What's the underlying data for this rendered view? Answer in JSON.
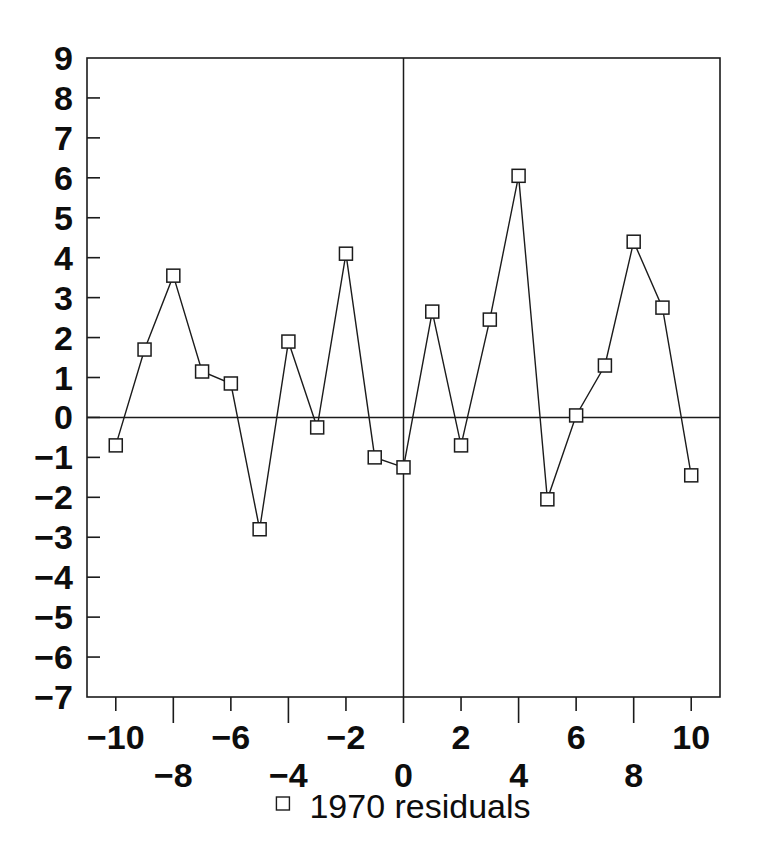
{
  "chart_data": {
    "type": "line",
    "title": "",
    "subtitle": "",
    "xlabel": "",
    "ylabel": "",
    "xlim": [
      -11,
      11
    ],
    "ylim": [
      -7,
      9
    ],
    "grid": false,
    "legend_position": "bottom-center",
    "marker_style": "open-square",
    "x": [
      -10,
      -9,
      -8,
      -7,
      -6,
      -5,
      -4,
      -3,
      -2,
      -1,
      0,
      1,
      2,
      3,
      4,
      5,
      6,
      7,
      8,
      9,
      10
    ],
    "series": [
      {
        "name": "1970 residuals",
        "values": [
          -0.7,
          1.7,
          3.55,
          1.15,
          0.85,
          -2.8,
          1.9,
          -0.25,
          4.1,
          -1.0,
          -1.25,
          2.65,
          -0.7,
          2.45,
          6.05,
          -2.05,
          0.05,
          1.3,
          4.4,
          2.75,
          -1.45
        ]
      }
    ],
    "y_ticks": [
      9,
      8,
      7,
      6,
      5,
      4,
      3,
      2,
      1,
      0,
      -1,
      -2,
      -3,
      -4,
      -5,
      -6,
      -7
    ],
    "y_tick_labels": [
      "9",
      "8",
      "7",
      "6",
      "5",
      "4",
      "3",
      "2",
      "1",
      "0",
      "−1",
      "−2",
      "−3",
      "−4",
      "−5",
      "−6",
      "−7"
    ],
    "x_ticks": [
      -10,
      -8,
      -6,
      -4,
      -2,
      0,
      2,
      4,
      6,
      8,
      10
    ],
    "x_tick_labels": [
      "−10",
      "−8",
      "−6",
      "−4",
      "−2",
      "0",
      "2",
      "4",
      "6",
      "8",
      "10"
    ],
    "reference_lines": [
      {
        "name": "y-zero",
        "axis": "horizontal",
        "value": 0
      },
      {
        "name": "x-zero",
        "axis": "vertical",
        "value": 0
      }
    ]
  },
  "legend": {
    "entries": [
      {
        "label": "1970 residuals",
        "marker": "open-square-marker"
      }
    ]
  },
  "colors": {
    "line": "#1b1b1b",
    "marker_fill": "#ffffff",
    "marker_stroke": "#1b1b1b",
    "axis": "#1b1b1b",
    "text": "#0d0d0d",
    "background": "#ffffff"
  }
}
